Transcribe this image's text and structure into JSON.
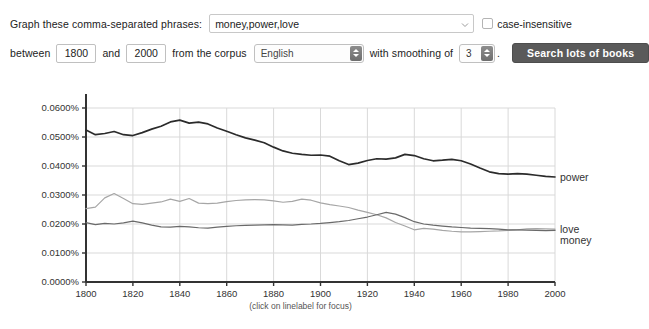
{
  "form": {
    "phrases_label": "Graph these comma-separated phrases:",
    "phrases_value": "money,power,love",
    "phrases_placeholder": "",
    "case_insensitive_label": "case-insensitive",
    "case_insensitive_checked": false,
    "between_label": "between",
    "start_year": "1800",
    "and_label": "and",
    "end_year": "2000",
    "corpus_label": "from the corpus",
    "corpus_value": "English",
    "smoothing_label": "with smoothing of",
    "smoothing_value": "3",
    "period": ".",
    "search_button_label": "Search lots of books"
  },
  "chart_footnote": "(click on linelabel for focus)",
  "colors": {
    "power": "#2b2b2b",
    "money": "#6a6a6a",
    "love": "#a6a6a6",
    "grid": "#d9d9d9",
    "axis": "#333333",
    "button": "#5a5a5a"
  },
  "chart_data": {
    "type": "line",
    "title": "",
    "xlabel": "",
    "ylabel": "",
    "xlim": [
      1800,
      2000
    ],
    "ylim": [
      0.0,
      0.06
    ],
    "grid": true,
    "legend_position": "right-inline-labels",
    "xticks": [
      1800,
      1820,
      1840,
      1860,
      1880,
      1900,
      1920,
      1940,
      1960,
      1980,
      2000
    ],
    "xticklabels": [
      "1800",
      "1820",
      "1840",
      "1860",
      "1880",
      "1900",
      "1920",
      "1940",
      "1960",
      "1980",
      "2000"
    ],
    "yticks": [
      0.0,
      0.01,
      0.02,
      0.03,
      0.04,
      0.05,
      0.06
    ],
    "yticklabels": [
      "0.0000%",
      "0.0100%",
      "0.0200%",
      "0.0300%",
      "0.0400%",
      "0.0500%",
      "0.0600%"
    ],
    "x": [
      1800,
      1804,
      1808,
      1812,
      1816,
      1820,
      1824,
      1828,
      1832,
      1836,
      1840,
      1844,
      1848,
      1852,
      1856,
      1860,
      1864,
      1868,
      1872,
      1876,
      1880,
      1884,
      1888,
      1892,
      1896,
      1900,
      1904,
      1908,
      1912,
      1916,
      1920,
      1924,
      1928,
      1932,
      1936,
      1940,
      1944,
      1948,
      1952,
      1956,
      1960,
      1964,
      1968,
      1972,
      1976,
      1980,
      1984,
      1988,
      1992,
      1996,
      2000
    ],
    "series": [
      {
        "name": "power",
        "color": "#2b2b2b",
        "label_position": "right",
        "values": [
          0.0524,
          0.0508,
          0.0512,
          0.0519,
          0.0508,
          0.0505,
          0.0515,
          0.0527,
          0.0537,
          0.0552,
          0.0558,
          0.0548,
          0.0551,
          0.0545,
          0.0531,
          0.052,
          0.0508,
          0.0497,
          0.0489,
          0.048,
          0.0465,
          0.0452,
          0.0444,
          0.044,
          0.0437,
          0.0438,
          0.0434,
          0.0418,
          0.0405,
          0.041,
          0.0419,
          0.0425,
          0.0424,
          0.0428,
          0.044,
          0.0436,
          0.0425,
          0.0418,
          0.042,
          0.0423,
          0.0418,
          0.0407,
          0.0393,
          0.038,
          0.0374,
          0.0372,
          0.0374,
          0.0372,
          0.0368,
          0.0364,
          0.0362
        ]
      },
      {
        "name": "love",
        "color": "#a6a6a6",
        "label_position": "right",
        "values": [
          0.0253,
          0.0258,
          0.029,
          0.0305,
          0.0288,
          0.027,
          0.0268,
          0.0272,
          0.0276,
          0.0286,
          0.0278,
          0.0288,
          0.0272,
          0.027,
          0.0272,
          0.0277,
          0.0281,
          0.0283,
          0.0284,
          0.0283,
          0.028,
          0.0275,
          0.0278,
          0.0286,
          0.0282,
          0.0273,
          0.0267,
          0.0262,
          0.0257,
          0.0248,
          0.024,
          0.0232,
          0.0221,
          0.0205,
          0.0193,
          0.018,
          0.0185,
          0.0182,
          0.0178,
          0.0175,
          0.0173,
          0.0173,
          0.0174,
          0.0175,
          0.0176,
          0.0178,
          0.018,
          0.0183,
          0.0184,
          0.0183,
          0.0182
        ]
      },
      {
        "name": "money",
        "color": "#6a6a6a",
        "label_position": "right",
        "values": [
          0.0205,
          0.0198,
          0.0202,
          0.02,
          0.0204,
          0.021,
          0.0204,
          0.0196,
          0.019,
          0.0189,
          0.0192,
          0.019,
          0.0187,
          0.0186,
          0.0189,
          0.0192,
          0.0194,
          0.0195,
          0.0196,
          0.0197,
          0.0198,
          0.0197,
          0.0196,
          0.0199,
          0.02,
          0.0202,
          0.0205,
          0.0208,
          0.0212,
          0.0218,
          0.0224,
          0.0232,
          0.024,
          0.0234,
          0.0222,
          0.0208,
          0.02,
          0.0196,
          0.0193,
          0.019,
          0.0188,
          0.0186,
          0.0185,
          0.0184,
          0.0182,
          0.018,
          0.018,
          0.0179,
          0.0178,
          0.0177,
          0.0178
        ]
      }
    ]
  }
}
